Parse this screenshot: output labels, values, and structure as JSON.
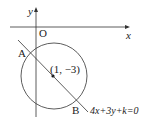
{
  "diagram": {
    "axes": {
      "x_label": "x",
      "y_label": "y",
      "origin_label": "O"
    },
    "circle": {
      "center_label": "(1, −3)",
      "center": [
        1,
        -3
      ]
    },
    "line": {
      "equation": "4x+3y+k=0"
    },
    "points": {
      "A": "A",
      "B": "B"
    },
    "colors": {
      "stroke": "#333333",
      "background": "#ffffff"
    }
  }
}
